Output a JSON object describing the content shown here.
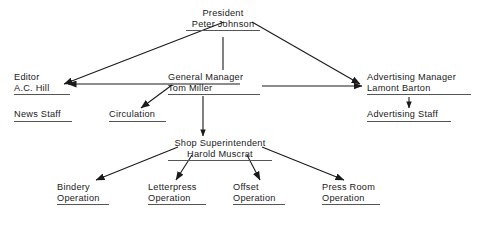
{
  "chart_data": {
    "type": "diagram",
    "diagram_kind": "organization-chart",
    "title": "",
    "nodes": [
      {
        "id": "president",
        "lines": [
          "President",
          "Peter Johnson"
        ],
        "underline": true,
        "x": 186,
        "y": 8,
        "width": 74,
        "align": "center"
      },
      {
        "id": "editor",
        "lines": [
          "Editor",
          "A.C. Hill"
        ],
        "underline": true,
        "x": 14,
        "y": 72,
        "width": 56,
        "align": "left"
      },
      {
        "id": "general-manager",
        "lines": [
          "General Manager",
          "Tom Miller"
        ],
        "underline": true,
        "x": 168,
        "y": 72,
        "width": 92,
        "align": "left"
      },
      {
        "id": "advertising-manager",
        "lines": [
          "Advertising Manager",
          "Lamont Barton"
        ],
        "underline": true,
        "x": 367,
        "y": 72,
        "width": 104,
        "align": "left"
      },
      {
        "id": "news-staff",
        "lines": [
          "News Staff"
        ],
        "underline": true,
        "x": 14,
        "y": 109,
        "width": 58,
        "align": "left"
      },
      {
        "id": "circulation",
        "lines": [
          "Circulation"
        ],
        "underline": true,
        "x": 109,
        "y": 109,
        "width": 57,
        "align": "left"
      },
      {
        "id": "advertising-staff",
        "lines": [
          "Advertising Staff"
        ],
        "underline": true,
        "x": 367,
        "y": 109,
        "width": 84,
        "align": "left"
      },
      {
        "id": "shop-superintendent",
        "lines": [
          "Shop Superintendent",
          "Harold Muscrat"
        ],
        "underline": true,
        "x": 168,
        "y": 138,
        "width": 104,
        "align": "center"
      },
      {
        "id": "bindery-operation",
        "lines": [
          "Bindery",
          "Operation"
        ],
        "underline": true,
        "x": 57,
        "y": 182,
        "width": 52,
        "align": "left"
      },
      {
        "id": "letterpress-operation",
        "lines": [
          "Letterpress",
          "Operation"
        ],
        "underline": true,
        "x": 148,
        "y": 182,
        "width": 58,
        "align": "left"
      },
      {
        "id": "offset-operation",
        "lines": [
          "Offset",
          "Operation"
        ],
        "underline": true,
        "x": 233,
        "y": 182,
        "width": 52,
        "align": "left"
      },
      {
        "id": "press-room-operation",
        "lines": [
          "Press Room",
          "Operation"
        ],
        "underline": true,
        "x": 322,
        "y": 182,
        "width": 58,
        "align": "left"
      }
    ],
    "edges": [
      {
        "id": "president-to-editor",
        "from": "president",
        "to": "editor",
        "kind": "diagonal-arrow",
        "x1": 224,
        "y1": 22,
        "x2": 64,
        "y2": 84
      },
      {
        "id": "president-to-advertising-manager",
        "from": "president",
        "to": "advertising-manager",
        "kind": "diagonal-arrow",
        "x1": 252,
        "y1": 22,
        "x2": 360,
        "y2": 84
      },
      {
        "id": "president-to-general-manager",
        "from": "president",
        "to": "general-manager",
        "kind": "vertical-line",
        "x1": 223,
        "y1": 37,
        "x2": 223,
        "y2": 70
      },
      {
        "id": "general-manager-to-editor",
        "from": "general-manager",
        "to": "editor",
        "kind": "horizontal-arrow",
        "x1": 240,
        "y1": 84,
        "x2": 68,
        "y2": 84
      },
      {
        "id": "general-manager-to-advertising-manager",
        "from": "general-manager",
        "to": "advertising-manager",
        "kind": "horizontal-arrow",
        "x1": 262,
        "y1": 86,
        "x2": 362,
        "y2": 86
      },
      {
        "id": "general-manager-to-circulation",
        "from": "general-manager",
        "to": "circulation",
        "kind": "diagonal-arrow",
        "x1": 172,
        "y1": 85,
        "x2": 141,
        "y2": 108
      },
      {
        "id": "general-manager-to-shop-superintendent",
        "from": "general-manager",
        "to": "shop-superintendent",
        "kind": "vertical-arrow",
        "x1": 203,
        "y1": 96,
        "x2": 203,
        "y2": 136
      },
      {
        "id": "advertising-manager-to-advertising-staff",
        "from": "advertising-manager",
        "to": "advertising-staff",
        "kind": "vertical-arrow",
        "x1": 409,
        "y1": 97,
        "x2": 409,
        "y2": 108
      },
      {
        "id": "shop-superintendent-to-bindery",
        "from": "shop-superintendent",
        "to": "bindery-operation",
        "kind": "diagonal-arrow",
        "x1": 178,
        "y1": 147,
        "x2": 96,
        "y2": 180
      },
      {
        "id": "shop-superintendent-to-letterpress",
        "from": "shop-superintendent",
        "to": "letterpress-operation",
        "kind": "diagonal-arrow",
        "x1": 192,
        "y1": 155,
        "x2": 176,
        "y2": 180
      },
      {
        "id": "shop-superintendent-to-offset",
        "from": "shop-superintendent",
        "to": "offset-operation",
        "kind": "diagonal-arrow",
        "x1": 247,
        "y1": 155,
        "x2": 260,
        "y2": 180
      },
      {
        "id": "shop-superintendent-to-press-room",
        "from": "shop-superintendent",
        "to": "press-room-operation",
        "kind": "diagonal-arrow",
        "x1": 262,
        "y1": 147,
        "x2": 344,
        "y2": 180
      }
    ],
    "style": {
      "background": "#ffffff",
      "text_color": "#1a1a1a",
      "line_color": "#1a1a1a",
      "rule_color": "#555555"
    }
  }
}
